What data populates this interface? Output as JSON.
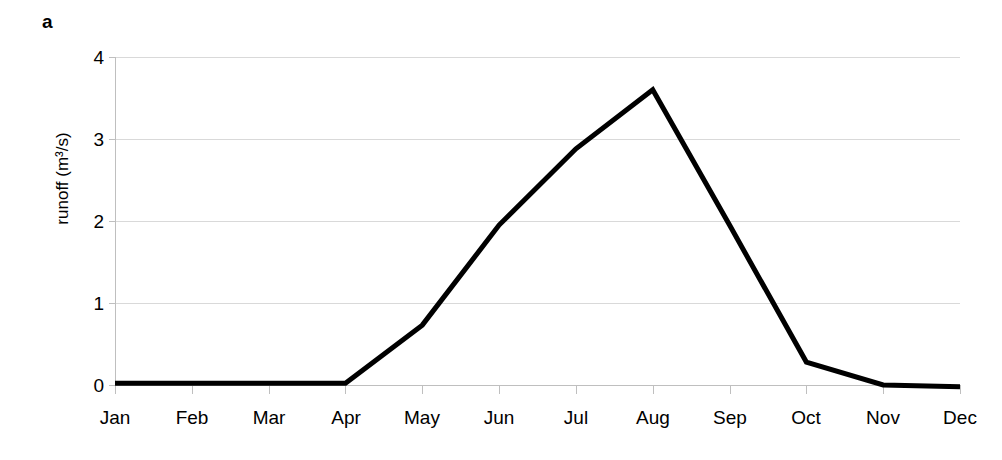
{
  "panel": {
    "letter": "a"
  },
  "chart_data": {
    "type": "line",
    "title": "",
    "subtitle": "",
    "xlabel": "",
    "ylabel": "runoff (m³/s)",
    "categories": [
      "Jan",
      "Feb",
      "Mar",
      "Apr",
      "May",
      "Jun",
      "Jul",
      "Aug",
      "Sep",
      "Oct",
      "Nov",
      "Dec"
    ],
    "values": [
      0.02,
      0.02,
      0.02,
      0.02,
      0.73,
      1.95,
      2.88,
      3.6,
      1.95,
      0.28,
      0.0,
      -0.02
    ],
    "series": [
      {
        "name": "runoff",
        "values": [
          0.02,
          0.02,
          0.02,
          0.02,
          0.73,
          1.95,
          2.88,
          3.6,
          1.95,
          0.28,
          0.0,
          -0.02
        ]
      }
    ],
    "ylim": [
      0,
      4
    ],
    "yticks": [
      0,
      1,
      2,
      3,
      4
    ],
    "ytick_labels": [
      "0",
      "1",
      "2",
      "3",
      "4"
    ],
    "xtick_labels": [
      "Jan",
      "Feb",
      "Mar",
      "Apr",
      "May",
      "Jun",
      "Jul",
      "Aug",
      "Sep",
      "Oct",
      "Nov",
      "Dec"
    ],
    "grid": "horizontal",
    "legend": "none",
    "line_color": "#000000",
    "grid_color": "#d9d9d9",
    "axis_color": "#bfbfbf",
    "line_width": 5
  }
}
